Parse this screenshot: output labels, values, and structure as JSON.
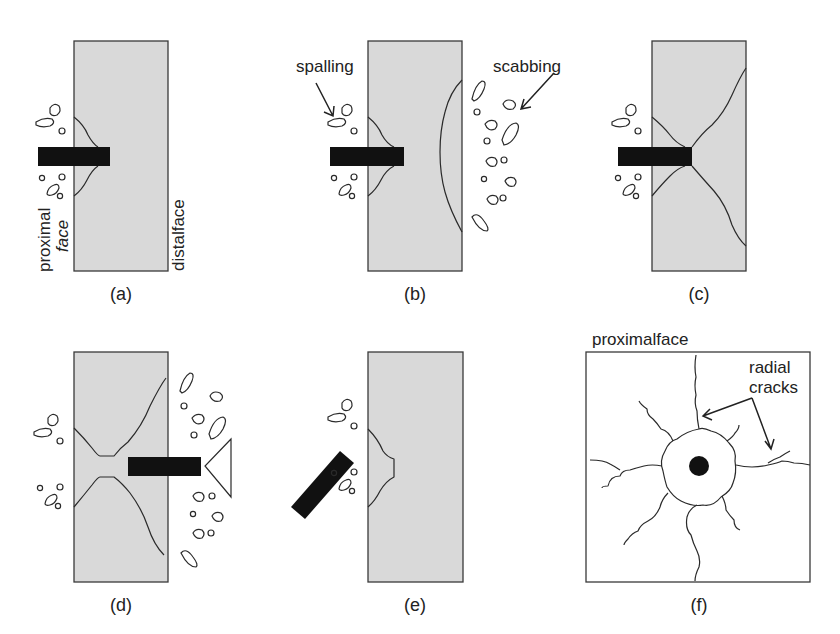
{
  "figure": {
    "panels": [
      {
        "id": "a",
        "caption": "(a)",
        "labels": {
          "proximal_face_line1": "proximal",
          "proximal_face_line2": "face",
          "distal_face": "distalface"
        }
      },
      {
        "id": "b",
        "caption": "(b)",
        "labels": {
          "spalling": "spalling",
          "scabbing": "scabbing"
        }
      },
      {
        "id": "c",
        "caption": "(c)"
      },
      {
        "id": "d",
        "caption": "(d)"
      },
      {
        "id": "e",
        "caption": "(e)"
      },
      {
        "id": "f",
        "caption": "(f)",
        "labels": {
          "proximal_face": "proximalface",
          "radial_line1": "radial",
          "radial_line2": "cracks"
        }
      }
    ]
  },
  "colors": {
    "target_fill": "#d9d9d9",
    "outline": "#3a3a3a",
    "projectile": "#111111",
    "background": "#ffffff"
  }
}
